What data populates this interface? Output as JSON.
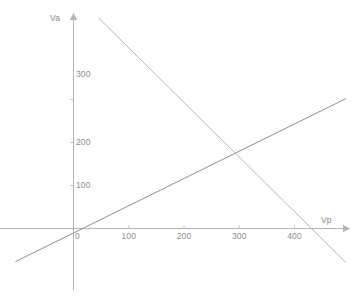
{
  "chart_data": {
    "type": "line",
    "title": "",
    "subtitle": "",
    "xlabel": "Vp",
    "ylabel": "Va",
    "grid": false,
    "legend": null,
    "xlim": [
      -105,
      495
    ],
    "ylim": [
      -140,
      410
    ],
    "xticks": [
      0,
      100,
      200,
      300,
      400
    ],
    "yticks": [
      100,
      200,
      300
    ],
    "xtick_labels": [
      "0",
      "100",
      "200",
      "300",
      "400"
    ],
    "ytick_labels": [
      "100",
      "200",
      "300"
    ],
    "origin_label": "0",
    "axis_arrow_x": "Vp",
    "axis_arrow_y": "Va",
    "series": [
      {
        "name": "rising-line",
        "color": "#8f8f8f",
        "points": [
          {
            "x": -105,
            "y": -77
          },
          {
            "x": 493,
            "y": 302
          }
        ],
        "slope": 0.634,
        "intercept": -10
      },
      {
        "name": "falling-line",
        "color": "#b8b8b8",
        "points": [
          {
            "x": 45,
            "y": 490
          },
          {
            "x": 493,
            "y": -79
          }
        ],
        "slope": -1.27,
        "intercept": 547
      }
    ],
    "intersection": {
      "x": 290,
      "y": 163
    },
    "x_intercept_falling": 434,
    "annotations": []
  },
  "colors": {
    "background": "#ffffff",
    "axis": "#b0b0b0",
    "text": "#8e8e8e",
    "rising_line": "#8f8f8f",
    "falling_line": "#bdbdbd"
  }
}
